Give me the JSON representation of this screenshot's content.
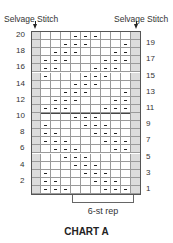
{
  "labels": {
    "selvage_left": "Selvage Stitch",
    "selvage_right": "Selvage Stitch",
    "repeat": "6-st rep",
    "title": "CHART A"
  },
  "chart_data": {
    "type": "table",
    "title": "CHART A",
    "columns": 11,
    "selvage_columns": [
      0,
      10
    ],
    "inner_columns": 9,
    "repeat": {
      "label": "6-st rep",
      "from_col": 4,
      "to_col": 9
    },
    "legend": {
      "dash": "purl (—)",
      "blank": "knit",
      "shaded": "selvage stitch"
    },
    "rows": [
      {
        "row": 20,
        "side": "left",
        "purls": [
          4,
          5,
          6
        ]
      },
      {
        "row": 19,
        "side": "right",
        "purls": [
          3,
          4,
          5,
          9
        ]
      },
      {
        "row": 18,
        "side": "left",
        "purls": [
          2,
          3,
          4,
          8,
          9
        ]
      },
      {
        "row": 17,
        "side": "right",
        "purls": [
          1,
          2,
          3,
          7,
          8,
          9
        ]
      },
      {
        "row": 16,
        "side": "left",
        "purls": [
          1,
          2,
          6,
          7,
          8
        ]
      },
      {
        "row": 15,
        "side": "right",
        "purls": [
          1,
          5,
          6,
          7
        ]
      },
      {
        "row": 14,
        "side": "left",
        "purls": [
          4,
          5,
          6
        ]
      },
      {
        "row": 13,
        "side": "right",
        "purls": [
          3,
          4,
          5,
          9
        ]
      },
      {
        "row": 12,
        "side": "left",
        "purls": [
          2,
          3,
          4,
          8,
          9
        ]
      },
      {
        "row": 11,
        "side": "right",
        "purls": [
          1,
          2,
          3,
          7,
          8,
          9
        ]
      },
      {
        "row": 10,
        "side": "left",
        "purls": [
          4,
          5,
          6
        ]
      },
      {
        "row": 9,
        "side": "right",
        "purls": [
          1,
          5,
          6,
          7
        ]
      },
      {
        "row": 8,
        "side": "left",
        "purls": [
          1,
          2,
          6,
          7,
          8
        ]
      },
      {
        "row": 7,
        "side": "right",
        "purls": [
          1,
          2,
          3,
          7,
          8,
          9
        ]
      },
      {
        "row": 6,
        "side": "left",
        "purls": [
          2,
          3,
          4,
          8,
          9
        ]
      },
      {
        "row": 5,
        "side": "right",
        "purls": [
          3,
          4,
          5
        ]
      },
      {
        "row": 4,
        "side": "left",
        "purls": [
          4,
          5,
          6
        ]
      },
      {
        "row": 3,
        "side": "right",
        "purls": [
          1,
          5,
          6,
          7
        ]
      },
      {
        "row": 2,
        "side": "left",
        "purls": [
          1,
          2,
          6,
          7,
          8
        ]
      },
      {
        "row": 1,
        "side": "right",
        "purls": [
          1,
          2,
          3,
          7,
          8,
          9
        ]
      }
    ]
  }
}
